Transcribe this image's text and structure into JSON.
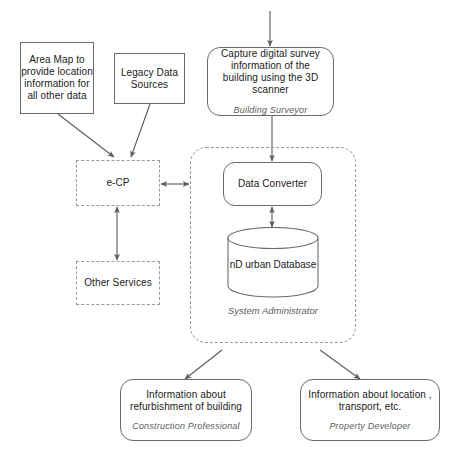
{
  "diagram": {
    "background_color": "#ffffff",
    "line_color": "#6b6b6b",
    "dashed_color": "#9a9a9a",
    "role_text_color": "#5d5d5d"
  },
  "nodes": {
    "area_map": {
      "label": "Area Map to provide location information for all other data",
      "border": "solid"
    },
    "legacy_data": {
      "label": "Legacy Data Sources",
      "border": "solid"
    },
    "capture_survey": {
      "label": "Capture digital survey information of the building using the 3D scanner",
      "role": "Building Surveyor",
      "border": "solid-rounded"
    },
    "ecp": {
      "label": "e-CP",
      "border": "dashed"
    },
    "other_services": {
      "label": "Other Services",
      "border": "dashed"
    },
    "data_converter": {
      "label": "Data Converter",
      "border": "solid-rounded"
    },
    "database": {
      "label": "nD urban Database",
      "shape": "cylinder"
    },
    "refurbishment": {
      "label": "Information about refurbishment of building",
      "role": "Construction Professional",
      "border": "solid-rounded"
    },
    "location_transport": {
      "label": "Information about location , transport, etc.",
      "role": "Property Developer",
      "border": "solid-rounded"
    }
  },
  "region": {
    "caption": "System Administrator",
    "border": "dashed-rounded"
  },
  "connections": [
    {
      "name": "inflow-to-capture-survey",
      "from": "top-edge",
      "to": "capture_survey",
      "arrow": "single"
    },
    {
      "name": "area-map-to-ecp",
      "from": "area_map",
      "to": "ecp",
      "arrow": "single"
    },
    {
      "name": "legacy-data-to-ecp",
      "from": "legacy_data",
      "to": "ecp",
      "arrow": "single"
    },
    {
      "name": "ecp-to-region",
      "from": "ecp",
      "to": "region",
      "arrow": "double"
    },
    {
      "name": "ecp-to-other-services",
      "from": "ecp",
      "to": "other_services",
      "arrow": "double"
    },
    {
      "name": "capture-survey-to-data-converter",
      "from": "capture_survey",
      "to": "data_converter",
      "arrow": "single"
    },
    {
      "name": "data-converter-to-database",
      "from": "data_converter",
      "to": "database",
      "arrow": "double"
    },
    {
      "name": "region-to-refurbishment",
      "from": "region",
      "to": "refurbishment",
      "arrow": "single"
    },
    {
      "name": "region-to-location-transport",
      "from": "region",
      "to": "location_transport",
      "arrow": "single"
    }
  ],
  "footer": {
    "caption": ""
  }
}
